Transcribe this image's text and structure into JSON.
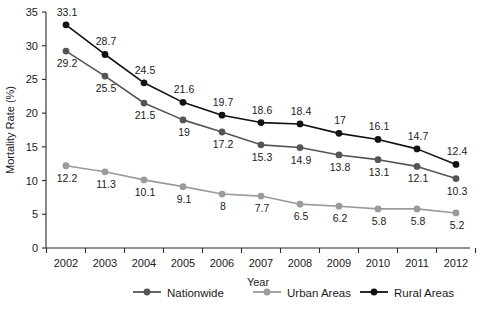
{
  "chart_data": {
    "type": "line",
    "title": "",
    "xlabel": "Year",
    "ylabel": "Mortality Rate (%)",
    "categories": [
      "2002",
      "2003",
      "2004",
      "2005",
      "2006",
      "2007",
      "2008",
      "2009",
      "2010",
      "2011",
      "2012"
    ],
    "x": [
      2002,
      2003,
      2004,
      2005,
      2006,
      2007,
      2008,
      2009,
      2010,
      2011,
      2012
    ],
    "ylim": [
      0,
      35
    ],
    "yticks": [
      "0",
      "5",
      "10",
      "15",
      "20",
      "25",
      "30",
      "35"
    ],
    "ytick_values": [
      0,
      5,
      10,
      15,
      20,
      25,
      30,
      35
    ],
    "grid": false,
    "legend_position": "bottom",
    "series": [
      {
        "name": "Nationwide",
        "color": "#555555",
        "label_position": "below",
        "values": [
          29.2,
          25.5,
          21.5,
          19,
          17.2,
          15.3,
          14.9,
          13.8,
          13.1,
          12.1,
          10.3
        ],
        "labels": [
          "29.2",
          "25.5",
          "21.5",
          "19",
          "17.2",
          "15.3",
          "14.9",
          "13.8",
          "13.1",
          "12.1",
          "10.3"
        ]
      },
      {
        "name": "Urban Areas",
        "color": "#9a9a9a",
        "label_position": "below",
        "values": [
          12.2,
          11.3,
          10.1,
          9.1,
          8,
          7.7,
          6.5,
          6.2,
          5.8,
          5.8,
          5.2
        ],
        "labels": [
          "12.2",
          "11.3",
          "10.1",
          "9.1",
          "8",
          "7.7",
          "6.5",
          "6.2",
          "5.8",
          "5.8",
          "5.2"
        ]
      },
      {
        "name": "Rural Areas",
        "color": "#111111",
        "label_position": "above",
        "values": [
          33.1,
          28.7,
          24.5,
          21.6,
          19.7,
          18.6,
          18.4,
          17,
          16.1,
          14.7,
          12.4
        ],
        "labels": [
          "33.1",
          "28.7",
          "24.5",
          "21.6",
          "19.7",
          "18.6",
          "18.4",
          "17",
          "16.1",
          "14.7",
          "12.4"
        ]
      }
    ]
  },
  "legend": {
    "items": [
      {
        "label": "Nationwide",
        "color": "#555555"
      },
      {
        "label": "Urban Areas",
        "color": "#9a9a9a"
      },
      {
        "label": "Rural Areas",
        "color": "#111111"
      }
    ]
  },
  "axes": {
    "x_title": "Year",
    "y_title": "Mortality Rate (%)"
  }
}
